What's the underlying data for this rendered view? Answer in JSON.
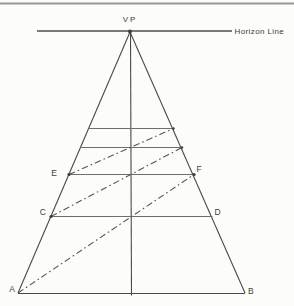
{
  "canvas": {
    "width": 294,
    "height": 306,
    "background": "#fcfcfa"
  },
  "colors": {
    "top_border": "#989898",
    "horizon": "#4f4f4f",
    "edge": "#4a4a4a",
    "transversal": "#6e6e6e",
    "diagonal": "#565656",
    "dot": "#3c3c3c",
    "text": "#3c3c3c"
  },
  "diagram": {
    "top_border": {
      "x1": 0,
      "y1": 3.5,
      "x2": 294,
      "y2": 3.5,
      "width": 2.2
    },
    "horizon_line": {
      "x1": 37,
      "y1": 31,
      "x2": 232,
      "y2": 31,
      "width": 1.4
    },
    "vp_dot": {
      "cx": 130,
      "cy": 31.5,
      "r": 1.9
    },
    "edges": [
      {
        "name": "triangle-left-edge",
        "x1": 130,
        "y1": 32,
        "x2": 18,
        "y2": 293
      },
      {
        "name": "triangle-right-edge",
        "x1": 130,
        "y1": 32,
        "x2": 245,
        "y2": 293
      },
      {
        "name": "base-line-ab",
        "x1": 18,
        "y1": 293.5,
        "x2": 245,
        "y2": 293.5
      },
      {
        "name": "center-vertical-line",
        "x1": 130.5,
        "y1": 32,
        "x2": 131.5,
        "y2": 295.5
      }
    ],
    "transversals": [
      {
        "name": "transversal-1",
        "x1": 88.5,
        "y1": 128.5,
        "x2": 173.5,
        "y2": 128.5
      },
      {
        "name": "transversal-2",
        "x1": 80.5,
        "y1": 147.5,
        "x2": 182,
        "y2": 147.5
      },
      {
        "name": "transversal-ef",
        "x1": 69,
        "y1": 174.5,
        "x2": 194,
        "y2": 174.5
      },
      {
        "name": "transversal-cd",
        "x1": 51,
        "y1": 216.5,
        "x2": 212.5,
        "y2": 216.5
      }
    ],
    "diagonals": [
      {
        "name": "diagonal-a-to-f",
        "x1": 18,
        "y1": 293,
        "x2": 194,
        "y2": 174.5
      },
      {
        "name": "diagonal-c-to-edge",
        "x1": 51,
        "y1": 216.5,
        "x2": 182,
        "y2": 147.5
      },
      {
        "name": "diagonal-e-to-edge",
        "x1": 69,
        "y1": 174.5,
        "x2": 173.5,
        "y2": 128.5
      }
    ],
    "dash_pattern": "6.5 3 1.6 3",
    "dots": [
      {
        "name": "point-dot-e",
        "cx": 69,
        "cy": 174.5,
        "r": 1.6
      },
      {
        "name": "point-dot-f",
        "cx": 194,
        "cy": 174.5,
        "r": 1.6
      },
      {
        "name": "point-dot-c",
        "cx": 51,
        "cy": 216.5,
        "r": 1.6
      },
      {
        "name": "point-dot-edge-1",
        "cx": 173.5,
        "cy": 128.5,
        "r": 1.2
      },
      {
        "name": "point-dot-edge-2",
        "cx": 182,
        "cy": 147.5,
        "r": 1.2
      }
    ],
    "labels": [
      {
        "name": "label-vp",
        "text": "VP",
        "x": 130,
        "y": 22,
        "anchor": "middle",
        "size": 8,
        "spacing": 2
      },
      {
        "name": "label-horizon",
        "text": "Horizon Line",
        "x": 234.5,
        "y": 33.5,
        "anchor": "start",
        "size": 8,
        "spacing": 0.4
      },
      {
        "name": "label-e",
        "text": "E",
        "x": 57,
        "y": 176,
        "anchor": "end",
        "size": 8.5,
        "spacing": 0
      },
      {
        "name": "label-f",
        "text": "F",
        "x": 196.5,
        "y": 172,
        "anchor": "start",
        "size": 8.5,
        "spacing": 0
      },
      {
        "name": "label-c",
        "text": "C",
        "x": 46,
        "y": 215,
        "anchor": "end",
        "size": 8.5,
        "spacing": 0
      },
      {
        "name": "label-d",
        "text": "D",
        "x": 214.5,
        "y": 214.5,
        "anchor": "start",
        "size": 8.5,
        "spacing": 0
      },
      {
        "name": "label-a",
        "text": "A",
        "x": 15,
        "y": 292,
        "anchor": "end",
        "size": 8.5,
        "spacing": 0
      },
      {
        "name": "label-b",
        "text": "B",
        "x": 248,
        "y": 294,
        "anchor": "start",
        "size": 8.5,
        "spacing": 0
      }
    ]
  }
}
